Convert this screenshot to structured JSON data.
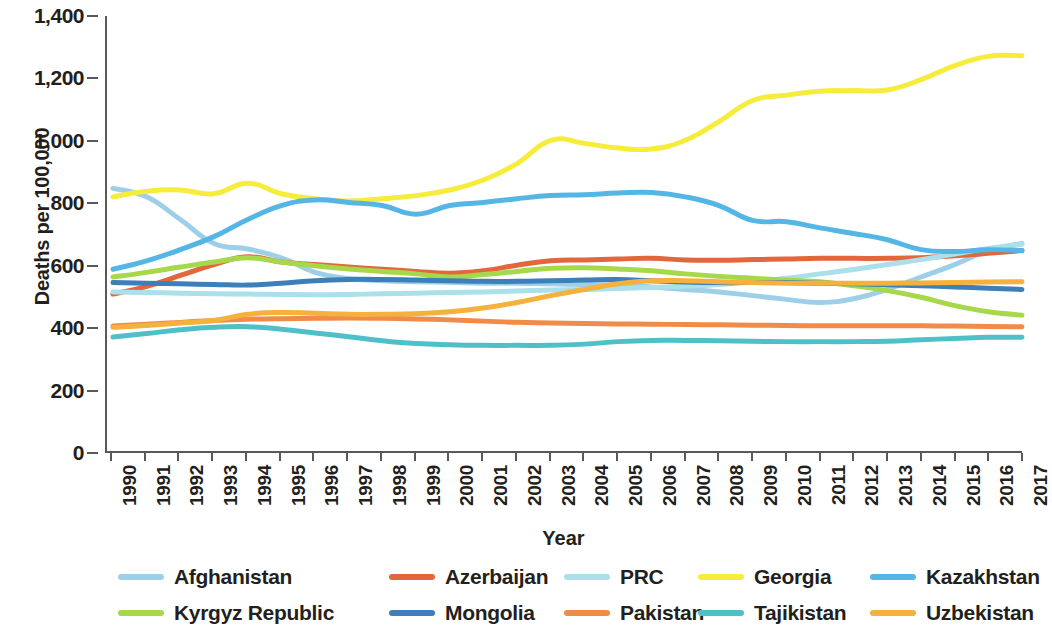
{
  "chart_data": {
    "type": "line",
    "title": "",
    "xlabel": "Year",
    "ylabel": "Deaths per 100,000",
    "x": [
      1990,
      1991,
      1992,
      1993,
      1994,
      1995,
      1996,
      1997,
      1998,
      1999,
      2000,
      2001,
      2002,
      2003,
      2004,
      2005,
      2006,
      2007,
      2008,
      2009,
      2010,
      2011,
      2012,
      2013,
      2014,
      2015,
      2016,
      2017
    ],
    "xtick_labels": [
      "1990",
      "1991",
      "1992",
      "1993",
      "1994",
      "1995",
      "1996",
      "1997",
      "1998",
      "1999",
      "2000",
      "2001",
      "2002",
      "2003",
      "2004",
      "2005",
      "2006",
      "2007",
      "2008",
      "2009",
      "2010",
      "2011",
      "2012",
      "2013",
      "2014",
      "2015",
      "2016",
      "2017"
    ],
    "ytick_labels": [
      "0",
      "200",
      "400",
      "600",
      "800",
      "1,000",
      "1,200",
      "1,400"
    ],
    "ytick_values": [
      0,
      200,
      400,
      600,
      800,
      1000,
      1200,
      1400
    ],
    "ylim": [
      0,
      1400
    ],
    "grid": false,
    "legend_position": "bottom",
    "series": [
      {
        "name": "Afghanistan",
        "color": "#9ecfe8",
        "values": [
          845,
          818,
          745,
          668,
          650,
          622,
          575,
          555,
          548,
          545,
          543,
          540,
          540,
          538,
          536,
          534,
          528,
          520,
          512,
          500,
          488,
          478,
          490,
          520,
          560,
          600,
          645,
          668
        ]
      },
      {
        "name": "Azerbaijan",
        "color": "#e2673c",
        "values": [
          505,
          530,
          565,
          600,
          625,
          608,
          600,
          592,
          585,
          578,
          572,
          580,
          598,
          612,
          615,
          618,
          620,
          615,
          614,
          616,
          618,
          620,
          620,
          620,
          622,
          628,
          636,
          645
        ]
      },
      {
        "name": "PRC",
        "color": "#a9e0ea",
        "values": [
          512,
          510,
          508,
          506,
          505,
          504,
          503,
          504,
          506,
          508,
          510,
          512,
          515,
          518,
          520,
          523,
          526,
          530,
          536,
          545,
          556,
          570,
          584,
          600,
          616,
          634,
          652,
          665
        ]
      },
      {
        "name": "Georgia",
        "color": "#f5ec3c",
        "values": [
          818,
          836,
          840,
          828,
          862,
          828,
          812,
          805,
          812,
          822,
          840,
          872,
          925,
          1000,
          990,
          975,
          972,
          1000,
          1060,
          1128,
          1145,
          1158,
          1160,
          1162,
          1195,
          1240,
          1270,
          1272
        ]
      },
      {
        "name": "Kazakhstan",
        "color": "#54b6e4",
        "values": [
          585,
          612,
          648,
          690,
          745,
          790,
          808,
          800,
          790,
          762,
          790,
          800,
          812,
          822,
          825,
          830,
          832,
          818,
          790,
          742,
          738,
          718,
          700,
          680,
          648,
          642,
          648,
          645
        ]
      },
      {
        "name": "Kyrgyz Republic",
        "color": "#a6d84a",
        "values": [
          560,
          575,
          592,
          608,
          622,
          608,
          596,
          586,
          578,
          570,
          560,
          568,
          578,
          588,
          590,
          586,
          580,
          570,
          562,
          556,
          550,
          545,
          532,
          516,
          495,
          468,
          448,
          437
        ]
      },
      {
        "name": "Mongolia",
        "color": "#3d7fb8",
        "values": [
          542,
          540,
          538,
          536,
          534,
          540,
          548,
          552,
          552,
          550,
          548,
          546,
          546,
          548,
          550,
          552,
          548,
          544,
          542,
          542,
          542,
          540,
          538,
          535,
          532,
          528,
          524,
          520
        ]
      },
      {
        "name": "Pakistan",
        "color": "#f08b49",
        "values": [
          402,
          408,
          414,
          420,
          424,
          426,
          427,
          428,
          427,
          425,
          422,
          418,
          414,
          412,
          410,
          409,
          408,
          407,
          406,
          405,
          404,
          403,
          403,
          403,
          403,
          402,
          401,
          400
        ]
      },
      {
        "name": "Tajikistan",
        "color": "#4fc0c8",
        "values": [
          367,
          378,
          390,
          398,
          400,
          392,
          380,
          368,
          355,
          346,
          342,
          340,
          340,
          340,
          344,
          352,
          356,
          356,
          355,
          353,
          352,
          352,
          352,
          353,
          358,
          362,
          366,
          366
        ]
      },
      {
        "name": "Uzbekistan",
        "color": "#f4b13d",
        "values": [
          398,
          404,
          412,
          420,
          440,
          446,
          443,
          440,
          440,
          442,
          448,
          460,
          478,
          500,
          520,
          538,
          548,
          548,
          545,
          542,
          540,
          540,
          540,
          540,
          541,
          542,
          544,
          545
        ]
      }
    ]
  },
  "legend": {
    "rows": [
      [
        {
          "label": "Afghanistan",
          "color": "#9ecfe8",
          "left": 0,
          "label_left": 60
        },
        {
          "label": "Azerbaijan",
          "color": "#e2673c",
          "left": 271,
          "label_left": 331
        },
        {
          "label": "PRC",
          "color": "#a9e0ea",
          "left": 446,
          "label_left": 506
        },
        {
          "label": "Georgia",
          "color": "#f5ec3c",
          "left": 580,
          "label_left": 640
        },
        {
          "label": "Kazakhstan",
          "color": "#54b6e4",
          "left": 752,
          "label_left": 812
        }
      ],
      [
        {
          "label": "Kyrgyz Republic",
          "color": "#a6d84a",
          "left": 0,
          "label_left": 60
        },
        {
          "label": "Mongolia",
          "color": "#3d7fb8",
          "left": 271,
          "label_left": 331
        },
        {
          "label": "Pakistan",
          "color": "#f08b49",
          "left": 446,
          "label_left": 506
        },
        {
          "label": "Tajikistan",
          "color": "#4fc0c8",
          "left": 580,
          "label_left": 640
        },
        {
          "label": "Uzbekistan",
          "color": "#f4b13d",
          "left": 752,
          "label_left": 812
        }
      ]
    ]
  },
  "axis_color": "#58595b"
}
